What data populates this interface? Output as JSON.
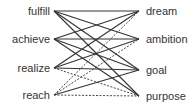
{
  "diagram": {
    "left_nodes": [
      {
        "id": "fulfill",
        "label": "fulfill",
        "y": 11
      },
      {
        "id": "achieve",
        "label": "achieve",
        "y": 39
      },
      {
        "id": "realize",
        "label": "realize",
        "y": 68
      },
      {
        "id": "reach",
        "label": "reach",
        "y": 95
      }
    ],
    "right_nodes": [
      {
        "id": "dream",
        "label": "dream",
        "y": 11
      },
      {
        "id": "ambition",
        "label": "ambition",
        "y": 39
      },
      {
        "id": "goal",
        "label": "goal",
        "y": 70
      },
      {
        "id": "purpose",
        "label": "purpose",
        "y": 96
      }
    ],
    "edges": [
      {
        "from": "fulfill",
        "to": "dream",
        "style": "solid"
      },
      {
        "from": "fulfill",
        "to": "ambition",
        "style": "solid"
      },
      {
        "from": "fulfill",
        "to": "goal",
        "style": "solid"
      },
      {
        "from": "fulfill",
        "to": "purpose",
        "style": "solid"
      },
      {
        "from": "achieve",
        "to": "dream",
        "style": "solid"
      },
      {
        "from": "achieve",
        "to": "ambition",
        "style": "solid"
      },
      {
        "from": "achieve",
        "to": "goal",
        "style": "solid"
      },
      {
        "from": "achieve",
        "to": "purpose",
        "style": "solid"
      },
      {
        "from": "realize",
        "to": "dream",
        "style": "solid"
      },
      {
        "from": "realize",
        "to": "ambition",
        "style": "solid"
      },
      {
        "from": "realize",
        "to": "goal",
        "style": "solid"
      },
      {
        "from": "realize",
        "to": "purpose",
        "style": "dashed"
      },
      {
        "from": "reach",
        "to": "dream",
        "style": "dashed"
      },
      {
        "from": "reach",
        "to": "ambition",
        "style": "dashed"
      },
      {
        "from": "reach",
        "to": "goal",
        "style": "solid"
      },
      {
        "from": "reach",
        "to": "purpose",
        "style": "dashed"
      }
    ],
    "colors": {
      "line": "#333333",
      "text": "#333333"
    }
  }
}
